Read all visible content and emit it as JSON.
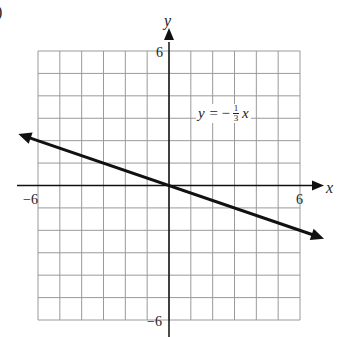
{
  "chart_data": {
    "type": "line",
    "title": "",
    "xlabel": "x",
    "ylabel": "y",
    "xlim": [
      -6,
      6
    ],
    "ylim": [
      -6,
      6
    ],
    "grid": true,
    "grid_step": 1,
    "tick_labels": {
      "x": [
        "-6",
        "6"
      ],
      "y": [
        "6",
        "-6"
      ]
    },
    "series": [
      {
        "name": "y = -1/3 x",
        "equation": "y = -(1/3)x",
        "slope": -0.3333,
        "intercept": 0,
        "x": [
          -6.9,
          -6,
          -3,
          0,
          3,
          6,
          7.1
        ],
        "y": [
          2.3,
          2,
          1,
          0,
          -1,
          -2,
          -2.37
        ],
        "arrows_both_ends": true
      }
    ],
    "annotations": [
      {
        "text": "y = -⅓x",
        "position": [
          3,
          3
        ]
      }
    ]
  },
  "labels": {
    "x_axis": "x",
    "y_axis": "y",
    "x_min": "−6",
    "x_max": "6",
    "y_max": "6",
    "y_min": "−6",
    "eq_lhs": "y =",
    "eq_sign": "−",
    "eq_num": "1",
    "eq_den": "3",
    "eq_var": "x",
    "corner_fragment": ")"
  },
  "colors": {
    "grid": "#9a9a9a",
    "axis": "#111111",
    "line": "#111111"
  }
}
